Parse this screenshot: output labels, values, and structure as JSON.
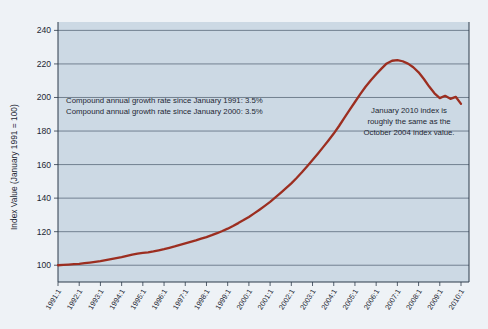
{
  "chart_data": {
    "type": "line",
    "title": "",
    "subtitle": "",
    "xlabel": "",
    "ylabel": "Index Value (January 1991 = 100)",
    "ylim": [
      90,
      245
    ],
    "yticks": [
      100,
      120,
      140,
      160,
      180,
      200,
      220,
      240
    ],
    "ytick_labels": [
      "100",
      "120",
      "140",
      "160",
      "180",
      "200",
      "220",
      "240"
    ],
    "grid": true,
    "legend": "none",
    "line_color": "#9c2e20",
    "plot_bg_color": "#ccd9e4",
    "page_bg_color": "#eef2f6",
    "xtick_labels": [
      "1991:1",
      "1992:1",
      "1993:1",
      "1994:1",
      "1995:1",
      "1996:1",
      "1997:1",
      "1998:1",
      "1999:1",
      "2000:1",
      "2001:1",
      "2002:1",
      "2003:1",
      "2004:1",
      "2005:1",
      "2006:1",
      "2007:1",
      "2008:1",
      "2009:1",
      "2010:1"
    ],
    "series": [
      {
        "name": "Index Value",
        "x": [
          1991.0,
          1991.25,
          1991.5,
          1991.75,
          1992.0,
          1992.25,
          1992.5,
          1992.75,
          1993.0,
          1993.25,
          1993.5,
          1993.75,
          1994.0,
          1994.25,
          1994.5,
          1994.75,
          1995.0,
          1995.25,
          1995.5,
          1995.75,
          1996.0,
          1996.25,
          1996.5,
          1996.75,
          1997.0,
          1997.25,
          1997.5,
          1997.75,
          1998.0,
          1998.25,
          1998.5,
          1998.75,
          1999.0,
          1999.25,
          1999.5,
          1999.75,
          2000.0,
          2000.25,
          2000.5,
          2000.75,
          2001.0,
          2001.25,
          2001.5,
          2001.75,
          2002.0,
          2002.25,
          2002.5,
          2002.75,
          2003.0,
          2003.25,
          2003.5,
          2003.75,
          2004.0,
          2004.25,
          2004.5,
          2004.75,
          2005.0,
          2005.25,
          2005.5,
          2005.75,
          2006.0,
          2006.25,
          2006.5,
          2006.75,
          2007.0,
          2007.25,
          2007.5,
          2007.75,
          2008.0,
          2008.25,
          2008.5,
          2008.75,
          2009.0,
          2009.25,
          2009.5,
          2009.75,
          2010.0
        ],
        "values": [
          100.0,
          100.2,
          100.4,
          100.6,
          100.8,
          101.2,
          101.6,
          102.0,
          102.4,
          103.0,
          103.6,
          104.2,
          104.8,
          105.6,
          106.3,
          106.9,
          107.3,
          107.6,
          108.2,
          108.9,
          109.6,
          110.4,
          111.2,
          112.1,
          113.0,
          113.9,
          114.8,
          115.8,
          116.8,
          117.9,
          119.1,
          120.4,
          121.8,
          123.4,
          125.1,
          126.9,
          128.8,
          130.9,
          133.1,
          135.4,
          137.8,
          140.4,
          143.1,
          145.9,
          148.8,
          152.0,
          155.4,
          159.0,
          162.7,
          166.5,
          170.4,
          174.4,
          178.5,
          183.0,
          187.8,
          192.6,
          197.3,
          202.0,
          206.4,
          210.3,
          213.8,
          217.2,
          220.3,
          221.9,
          222.3,
          221.6,
          220.2,
          218.0,
          215.0,
          211.0,
          206.5,
          202.5,
          199.6,
          201.0,
          199.2,
          200.4,
          196.2
        ]
      }
    ],
    "annotations": [
      {
        "id": "growth-rate-box",
        "lines": [
          "Compound annual growth rate since January 1991:  3.5%",
          "Compound annual growth rate since January 2000:  3.5%"
        ]
      },
      {
        "id": "jan-2010-note",
        "lines": [
          "January 2010 index is",
          "roughly the same as the",
          "October 2004 index value."
        ]
      }
    ]
  }
}
